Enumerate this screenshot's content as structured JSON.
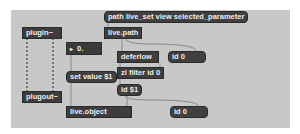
{
  "patcher": {
    "background_color": "#c8c8c8",
    "objects": [
      {
        "id": "msg-path",
        "type": "message",
        "text": "path live_set view selected_parameter"
      },
      {
        "id": "live-path",
        "type": "object",
        "text": "live.path"
      },
      {
        "id": "plugin",
        "type": "object",
        "text": "plugin~"
      },
      {
        "id": "plugout",
        "type": "object",
        "text": "plugout~"
      },
      {
        "id": "flonum",
        "type": "flonum",
        "arrow": "▸",
        "value": "0."
      },
      {
        "id": "deferlow",
        "type": "object",
        "text": "deferlow"
      },
      {
        "id": "msg-id0-upper",
        "type": "message",
        "text": "id 0"
      },
      {
        "id": "zl-filter",
        "type": "object",
        "text": "zl filter id 0"
      },
      {
        "id": "msg-set-value",
        "type": "message",
        "text": "set value $1"
      },
      {
        "id": "msg-id-arg",
        "type": "message",
        "text": "id $1"
      },
      {
        "id": "live-object",
        "type": "object",
        "text": "live.object"
      },
      {
        "id": "msg-id0-lower",
        "type": "message",
        "text": "id 0"
      }
    ],
    "colors": {
      "box": "#3d3d3d",
      "text": "#eeeeee",
      "cord": "#8a8a8a",
      "signal_cord": "#555555"
    }
  }
}
